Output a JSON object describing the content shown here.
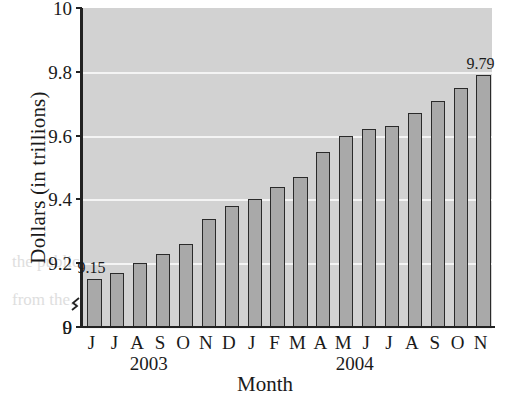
{
  "chart_data": {
    "type": "bar",
    "title": "",
    "xlabel": "Month",
    "ylabel": "Dollars (in trillions)",
    "categories": [
      "J",
      "J",
      "A",
      "S",
      "O",
      "N",
      "D",
      "J",
      "F",
      "M",
      "A",
      "M",
      "J",
      "J",
      "A",
      "S",
      "O",
      "N"
    ],
    "group_labels": [
      "2003",
      "2004"
    ],
    "values": [
      9.15,
      9.17,
      9.2,
      9.23,
      9.26,
      9.34,
      9.38,
      9.4,
      9.44,
      9.47,
      9.55,
      9.6,
      9.62,
      9.63,
      9.67,
      9.71,
      9.75,
      9.79
    ],
    "point_labels": [
      {
        "index": 0,
        "text": "9.15"
      },
      {
        "index": 17,
        "text": "9.79"
      }
    ],
    "ytick_labels": [
      "10",
      "9.8",
      "9.6",
      "9.4",
      "9.2",
      "9",
      "0"
    ],
    "ytick_values": [
      10,
      9.8,
      9.6,
      9.4,
      9.2,
      9,
      0
    ],
    "ylim": [
      9.0,
      10.0
    ],
    "axis_break": true,
    "grid": true,
    "legend": false,
    "colors": {
      "bar_fill": "#a9a9a9",
      "bar_border": "#2a2a2a",
      "plot_background": "#d2d2d2",
      "gridline": "#f4f4f4",
      "axis": "#222222",
      "text": "#1a1a1a"
    }
  },
  "ghost_text": {
    "line1": "the public, the",
    "line2": "from the..."
  }
}
